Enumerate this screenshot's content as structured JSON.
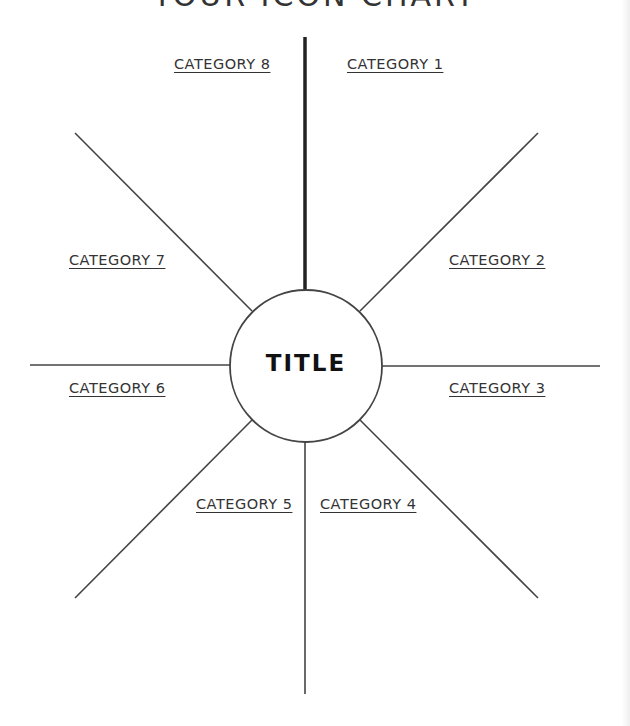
{
  "heading": "YOUR ICON CHART",
  "center": {
    "title": "TITLE"
  },
  "categories": [
    {
      "label": "CATEGORY 1"
    },
    {
      "label": "CATEGORY 2"
    },
    {
      "label": "CATEGORY 3"
    },
    {
      "label": "CATEGORY 4"
    },
    {
      "label": "CATEGORY 5"
    },
    {
      "label": "CATEGORY 6"
    },
    {
      "label": "CATEGORY 7"
    },
    {
      "label": "CATEGORY 8"
    }
  ],
  "colors": {
    "line": "#444444",
    "text": "#333333",
    "background": "#ffffff"
  }
}
